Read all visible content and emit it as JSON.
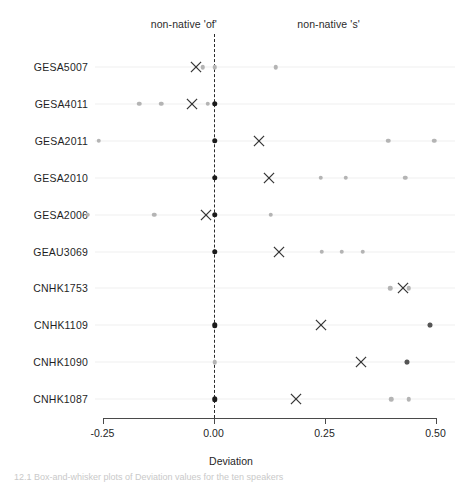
{
  "chart_data": {
    "type": "scatter",
    "title": "",
    "xlabel": "Deviation",
    "ylabel": "",
    "xlim": [
      -0.3,
      0.52
    ],
    "xticks": [
      -0.25,
      0.0,
      0.25,
      0.5
    ],
    "xticklabels": [
      "-0.25",
      "0.00",
      "0.25",
      "0.50"
    ],
    "grid": false,
    "legend_position": "none",
    "reference_line": {
      "value": 0.0,
      "style": "dashed",
      "label": "zero deviation"
    },
    "annotations": [
      {
        "text": "non-native 'of'",
        "x": -0.04,
        "position": "top-left"
      },
      {
        "text": "non-native 's'",
        "x": 0.29,
        "position": "top-right"
      }
    ],
    "categories": [
      "GESA5007",
      "GESA4011",
      "GESA2011",
      "GESA2010",
      "GESA2006",
      "GEAU3069",
      "CNHK1753",
      "CNHK1109",
      "CNHK1090",
      "CNHK1087"
    ],
    "series": [
      {
        "name": "individual observations",
        "marker": "dot",
        "color": "#b4b4b4",
        "points": [
          {
            "category": "GESA5007",
            "values": [
              -0.0246,
              0.0023,
              0.1398
            ]
          },
          {
            "category": "GESA4011",
            "values": [
              -0.1675,
              -0.1178,
              -0.0135,
              0.0023
            ]
          },
          {
            "category": "GESA2011",
            "values": [
              -0.2584,
              0.3941,
              0.4973
            ]
          },
          {
            "category": "GESA2010",
            "values": [
              0.2412,
              0.2975,
              0.4324
            ]
          },
          {
            "category": "GESA2006",
            "values": [
              -0.2832,
              -0.134,
              0.1289
            ]
          },
          {
            "category": "GEAU3069",
            "values": [
              0.2435,
              0.2885,
              0.3356
            ]
          },
          {
            "category": "CNHK1753",
            "values": [
              0.3986,
              0.4392
            ]
          },
          {
            "category": "CNHK1109",
            "values": [
              0.4865
            ]
          },
          {
            "category": "CNHK1090",
            "values": [
              0.0023,
              0.4347
            ]
          },
          {
            "category": "CNHK1087",
            "values": [
              0.4009,
              0.4392
            ]
          }
        ]
      },
      {
        "name": "group mean",
        "marker": "x",
        "color": "#333333",
        "points": [
          {
            "category": "GESA5007",
            "value": -0.0405
          },
          {
            "category": "GESA4011",
            "value": -0.0495
          },
          {
            "category": "GESA2011",
            "value": 0.1036
          },
          {
            "category": "GESA2010",
            "value": 0.1239
          },
          {
            "category": "GESA2006",
            "value": -0.018
          },
          {
            "category": "GEAU3069",
            "value": 0.1464
          },
          {
            "category": "CNHK1753",
            "value": 0.4257
          },
          {
            "category": "CNHK1109",
            "value": 0.241
          },
          {
            "category": "CNHK1090",
            "value": 0.3311
          },
          {
            "category": "CNHK1087",
            "value": 0.1847
          }
        ]
      },
      {
        "name": "median marker",
        "marker": "filled-dot",
        "color": "#1a1a1a",
        "points": [
          {
            "category": "GESA4011",
            "value": 0.0023
          },
          {
            "category": "GESA2011",
            "value": 0.0023
          },
          {
            "category": "GESA2010",
            "value": 0.0023
          },
          {
            "category": "GESA2006",
            "value": 0.0023
          },
          {
            "category": "GEAU3069",
            "value": 0.0023
          },
          {
            "category": "CNHK1109",
            "value": 0.0023
          },
          {
            "category": "CNHK1087",
            "value": 0.0023
          }
        ]
      }
    ]
  },
  "figure": {
    "axis_title": "Deviation",
    "caption": "12.1   Box-and-whisker plots of Deviation values for the ten speakers"
  }
}
